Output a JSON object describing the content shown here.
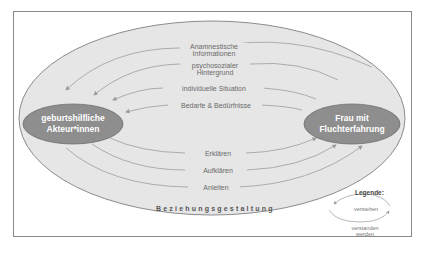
{
  "diagram": {
    "outer_ellipse_label": "Beziehungsgestaltung",
    "nodes": {
      "left": {
        "line1": "geburtshilfliche",
        "line2": "Akteur*innen"
      },
      "right": {
        "line1": "Frau mit",
        "line2": "Fluchterfahrung"
      }
    },
    "upper_flows": [
      {
        "line1": "Anamnestische",
        "line2": "Informationen"
      },
      {
        "line1": "psychosozialer",
        "line2": "Hintergrund"
      },
      {
        "line1": "individuelle Situation"
      },
      {
        "line1": "Bedarfe & Bedürfnisse"
      }
    ],
    "lower_flows": [
      {
        "line1": "Erklären"
      },
      {
        "line1": "Aufklären"
      },
      {
        "line1": "Anleiten"
      }
    ],
    "legend": {
      "title": "Legende:",
      "top_label": "verstehen",
      "bottom_label_line1": "verstanden",
      "bottom_label_line2": "werden"
    },
    "colors": {
      "outer_fill": "#e6e6e6",
      "outer_stroke": "#8c8c8c",
      "node_fill": "#8e8e8e",
      "arrow": "#a0a0a0"
    }
  }
}
